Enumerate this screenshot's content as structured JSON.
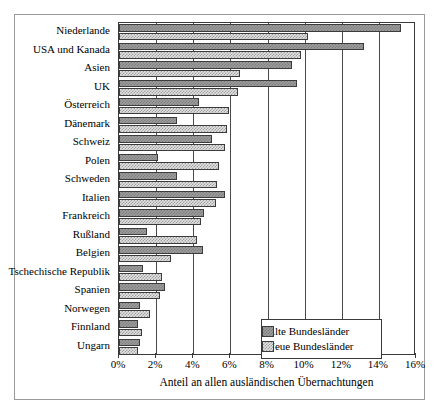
{
  "chart_data": {
    "type": "bar",
    "orientation": "horizontal",
    "title": "",
    "xlabel": "Anteil an allen ausländischen Übernachtungen",
    "ylabel": "",
    "xlim": [
      0,
      16
    ],
    "xticks": [
      "0%",
      "2%",
      "4%",
      "6%",
      "8%",
      "10%",
      "12%",
      "14%",
      "16%"
    ],
    "xtick_values": [
      0,
      2,
      4,
      6,
      8,
      10,
      12,
      14,
      16
    ],
    "grid": true,
    "legend_position": "bottom-right",
    "categories": [
      "Niederlande",
      "USA und Kanada",
      "Asien",
      "UK",
      "Österreich",
      "Dänemark",
      "Schweiz",
      "Polen",
      "Schweden",
      "Italien",
      "Frankreich",
      "Rußland",
      "Belgien",
      "Tschechische Republik",
      "Spanien",
      "Norwegen",
      "Finnland",
      "Ungarn"
    ],
    "series": [
      {
        "name": "Alte Bundesländer",
        "color": "#9d9d9d",
        "values": [
          15.2,
          13.2,
          9.3,
          9.6,
          4.3,
          3.1,
          5.0,
          2.1,
          3.1,
          5.7,
          4.6,
          1.5,
          4.5,
          1.3,
          2.5,
          1.15,
          1.0,
          1.15
        ]
      },
      {
        "name": "Neue Bundesländer",
        "color": "#e3e3e3",
        "values": [
          10.2,
          9.8,
          6.5,
          6.4,
          5.9,
          5.8,
          5.7,
          5.4,
          5.3,
          5.2,
          4.4,
          4.2,
          2.8,
          2.3,
          2.2,
          1.65,
          1.25,
          1.0
        ]
      }
    ]
  },
  "legend": {
    "items": [
      {
        "label": "Alte Bundesländer",
        "swatch": "dark-hatch-swatch"
      },
      {
        "label": "Neue Bundesländer",
        "swatch": "light-hatch-swatch"
      }
    ]
  }
}
